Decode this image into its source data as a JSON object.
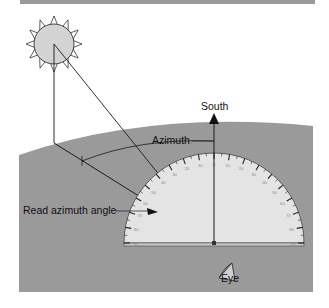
{
  "figure": {
    "type": "diagram",
    "labels": {
      "south": "South",
      "azimuth": "Azimuth",
      "read_angle": "Read azimuth angle",
      "eye": "Eye"
    },
    "protractor": {
      "tick_labels_left": [
        "10",
        "20",
        "30",
        "40",
        "50",
        "60",
        "70",
        "80",
        "90"
      ],
      "center_label": "0",
      "tick_labels_right": [
        "10",
        "20",
        "30",
        "40",
        "50",
        "60",
        "70",
        "80",
        "90"
      ]
    },
    "colors": {
      "ground": "#9a9a9a",
      "top_bar": "#9a9a9a",
      "sun_fill": "#d3d3d3",
      "protractor_fill": "#e4e4e4",
      "lines": "#1a1a1a",
      "background": "#ffffff"
    },
    "icons": {
      "sun": "sun-icon",
      "eye": "eye-icon",
      "arrow": "arrow-up-icon"
    }
  }
}
